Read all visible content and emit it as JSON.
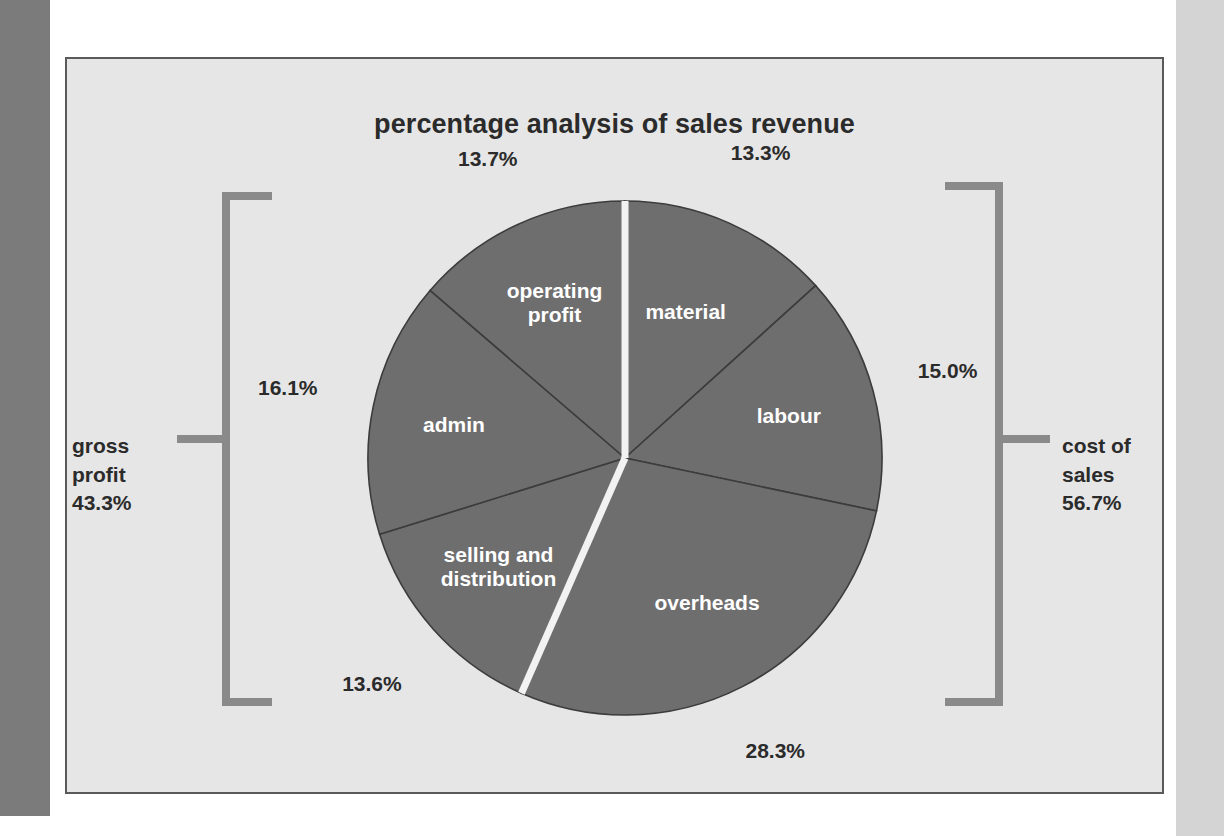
{
  "page": {
    "background_color": "#ffffff",
    "left_bar_color": "#7b7b7b",
    "right_bar_color": "#d4d4d4"
  },
  "panel": {
    "background_color": "#e6e6e6",
    "border_color": "#5a5a5a"
  },
  "chart_data": {
    "type": "pie",
    "title": "percentage analysis of sales revenue",
    "xlabel": "",
    "ylabel": "",
    "legend_position": "none",
    "grid": false,
    "units": "percent",
    "slice_color": "#6e6e6e",
    "slice_outline_color": "#3c3c3c",
    "group_divider_color": "#f2f2f2",
    "label_text_color": "#ffffff",
    "value_text_color": "#2b2b2b",
    "start_angle_deg": 0,
    "direction": "clockwise",
    "categories": [
      "material",
      "labour",
      "overheads",
      "selling and distribution",
      "admin",
      "operating profit"
    ],
    "values": [
      13.3,
      15.0,
      28.3,
      13.6,
      16.1,
      13.7
    ],
    "slices": [
      {
        "label": "material",
        "display_label": "material",
        "value": 13.3,
        "value_text": "13.3%",
        "group": "cost of sales"
      },
      {
        "label": "labour",
        "display_label": "labour",
        "value": 15.0,
        "value_text": "15.0%",
        "group": "cost of sales"
      },
      {
        "label": "overheads",
        "display_label": "overheads",
        "value": 28.3,
        "value_text": "28.3%",
        "group": "cost of sales"
      },
      {
        "label": "selling and distribution",
        "display_label": "selling and\ndistribution",
        "value": 13.6,
        "value_text": "13.6%",
        "group": "gross profit"
      },
      {
        "label": "admin",
        "display_label": "admin",
        "value": 16.1,
        "value_text": "16.1%",
        "group": "gross profit"
      },
      {
        "label": "operating profit",
        "display_label": "operating\nprofit",
        "value": 13.7,
        "value_text": "13.7%",
        "group": "gross profit"
      }
    ],
    "groups": [
      {
        "name": "gross profit",
        "label": "gross\nprofit",
        "value": 43.3,
        "value_text": "43.3%",
        "side": "left",
        "bracket_color": "#8a8a8a"
      },
      {
        "name": "cost of sales",
        "label": "cost of\nsales",
        "value": 56.7,
        "value_text": "56.7%",
        "side": "right",
        "bracket_color": "#8a8a8a"
      }
    ],
    "total": 100.0
  }
}
